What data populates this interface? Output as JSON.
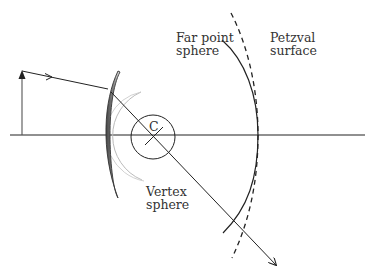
{
  "diagram": {
    "labels": {
      "far_point_line1": "Far point",
      "far_point_line2": "sphere",
      "petzval_line1": "Petzval",
      "petzval_line2": "surface",
      "vertex_line1": "Vertex",
      "vertex_line2": "sphere",
      "center": "C"
    },
    "colors": {
      "line": "#222222",
      "vertex_sphere": "#bbbbbb",
      "lens_dark": "#555555",
      "lens_light": "#e6e6e6",
      "object_arrow": "#555555"
    }
  }
}
